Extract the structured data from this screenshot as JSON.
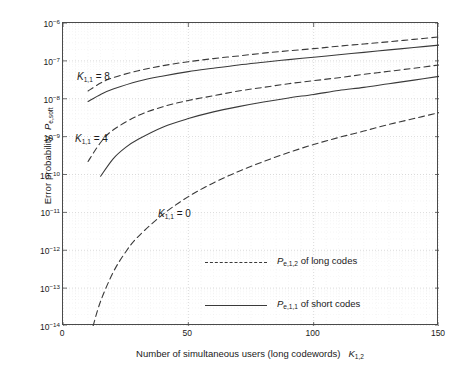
{
  "axes": {
    "ylabel_prefix": "Error probability",
    "ylabel_symbol": "P",
    "ylabel_sub": "e,soft",
    "xlabel_text": "Number of simultaneous users (long codewords)",
    "xlabel_symbol": "K",
    "xlabel_sub": "1,2",
    "yticks": [
      "-6",
      "-7",
      "-8",
      "-9",
      "-10",
      "-11",
      "-12",
      "-13",
      "-14"
    ],
    "ytick_base": "10",
    "xticks": [
      "0",
      "50",
      "100",
      "150"
    ]
  },
  "annotations": [
    {
      "symbol": "K",
      "sub": "1,1",
      "eq": "= 8"
    },
    {
      "symbol": "K",
      "sub": "1,1",
      "eq": "= 4"
    },
    {
      "symbol": "K",
      "sub": "1,1",
      "eq": "= 0"
    }
  ],
  "legend": [
    {
      "symbol": "P",
      "sub": "e,1,2",
      "text": "of long codes",
      "style": "dashed"
    },
    {
      "symbol": "P",
      "sub": "e,1,1",
      "text": "of short codes",
      "style": "solid"
    }
  ],
  "colors": {
    "curve": "#3a3a3a",
    "frame": "#4a4a4a",
    "grid": "#c9c9c9",
    "background": "#ffffff"
  },
  "chart_data": {
    "type": "line",
    "title": "",
    "xlabel": "Number of simultaneous users (long codewords) K_1,2",
    "ylabel": "Error probability P_e,soft",
    "xlim": [
      0,
      150
    ],
    "ylim": [
      1e-14,
      1e-06
    ],
    "yscale": "log",
    "xscale": "linear",
    "grid": true,
    "legend_position": "lower-right-inside",
    "series": [
      {
        "name": "K_1,1 = 8, P_e,1,2 of long codes",
        "group": "K_1,1 = 8",
        "style": "dashed",
        "x": [
          10,
          15,
          20,
          30,
          40,
          50,
          60,
          70,
          80,
          90,
          100,
          110,
          120,
          130,
          140,
          150
        ],
        "y": [
          1.6e-08,
          2.6e-08,
          3.6e-08,
          5.5e-08,
          7.5e-08,
          9.5e-08,
          1.15e-07,
          1.35e-07,
          1.6e-07,
          1.85e-07,
          2.1e-07,
          2.45e-07,
          2.8e-07,
          3.2e-07,
          3.7e-07,
          4.3e-07
        ]
      },
      {
        "name": "K_1,1 = 8, P_e,1,1 of short codes",
        "group": "K_1,1 = 8",
        "style": "solid",
        "x": [
          10,
          15,
          20,
          30,
          40,
          50,
          60,
          70,
          80,
          90,
          100,
          110,
          120,
          130,
          140,
          150
        ],
        "y": [
          8.5e-09,
          1.3e-08,
          1.8e-08,
          2.9e-08,
          4e-08,
          5.2e-08,
          6.4e-08,
          7.8e-08,
          9.2e-08,
          1.08e-07,
          1.25e-07,
          1.45e-07,
          1.68e-07,
          1.95e-07,
          2.25e-07,
          2.6e-07
        ]
      },
      {
        "name": "K_1,1 = 4, P_e,1,2 of long codes",
        "group": "K_1,1 = 4",
        "style": "dashed",
        "x": [
          10,
          15,
          20,
          30,
          40,
          50,
          60,
          70,
          80,
          90,
          100,
          110,
          120,
          130,
          140,
          150
        ],
        "y": [
          2.2e-10,
          7e-10,
          1.5e-09,
          3.6e-09,
          6.2e-09,
          9e-09,
          1.2e-08,
          1.6e-08,
          2e-08,
          2.5e-08,
          3e-08,
          3.6e-08,
          4.4e-08,
          5.3e-08,
          6.4e-08,
          7.8e-08
        ]
      },
      {
        "name": "K_1,1 = 4, P_e,1,1 of short codes",
        "group": "K_1,1 = 4",
        "style": "solid",
        "x": [
          15,
          20,
          25,
          30,
          40,
          50,
          60,
          70,
          80,
          90,
          100,
          110,
          120,
          130,
          140,
          150
        ],
        "y": [
          9e-11,
          2.6e-10,
          5.2e-10,
          8.5e-10,
          1.8e-09,
          3e-09,
          4.5e-09,
          6.2e-09,
          8.2e-09,
          1.05e-08,
          1.3e-08,
          1.65e-08,
          2e-08,
          2.5e-08,
          3.1e-08,
          3.9e-08
        ]
      },
      {
        "name": "K_1,1 = 0, P_e,1,2 of long codes",
        "group": "K_1,1 = 0",
        "style": "dashed",
        "x": [
          12,
          15,
          20,
          25,
          30,
          40,
          50,
          60,
          70,
          80,
          90,
          100,
          110,
          120,
          130,
          140,
          150
        ],
        "y": [
          1e-14,
          4.5e-14,
          2.6e-13,
          9e-13,
          2.3e-12,
          9e-12,
          2.6e-11,
          6e-11,
          1.2e-10,
          2.2e-10,
          3.8e-10,
          6.2e-10,
          9.5e-10,
          1.4e-09,
          2.1e-09,
          3e-09,
          4.3e-09
        ]
      }
    ]
  }
}
